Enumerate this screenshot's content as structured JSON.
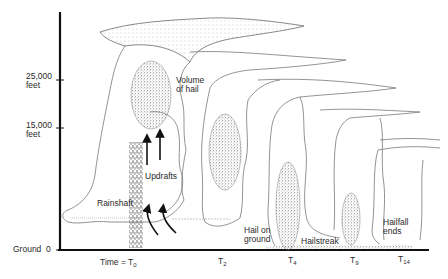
{
  "axis": {
    "y_labels": [
      {
        "value": "25,000",
        "unit": "feet"
      },
      {
        "value": "15,000",
        "unit": "feet"
      }
    ],
    "ground_label": "Ground",
    "ground_value": "0",
    "time_prefix": "Time = T",
    "time_ticks": [
      {
        "base": "T",
        "sub": "0"
      },
      {
        "base": "T",
        "sub": "2"
      },
      {
        "base": "T",
        "sub": "4"
      },
      {
        "base": "T",
        "sub": "9"
      },
      {
        "base": "T",
        "sub": "14"
      }
    ]
  },
  "annotations": {
    "volume_line1": "Volume",
    "volume_line2": "of hail",
    "updrafts": "Updrafts",
    "rainshaft": "Rainshaft",
    "hail_ground_line1": "Hail on",
    "hail_ground_line2": "ground",
    "hailstreak": "Hailstreak",
    "hailfall_line1": "Hailfall",
    "hailfall_line2": "ends"
  },
  "colors": {
    "ink": "#1a1a1a",
    "outline": "#6a6a6a",
    "stipple": "#555555"
  }
}
